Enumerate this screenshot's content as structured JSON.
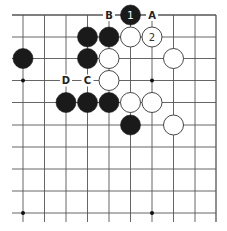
{
  "diagram": {
    "type": "go-board-section",
    "columns": 10,
    "rows": 10,
    "edges": {
      "top": true,
      "right": true,
      "left": false,
      "bottom": false
    },
    "grid": {
      "x": [
        23,
        44.5,
        66,
        87.5,
        109,
        130.5,
        152,
        173.5,
        195,
        216
      ],
      "y": [
        15,
        37,
        58.5,
        80.5,
        102.5,
        125,
        147,
        169,
        191,
        213
      ],
      "overhang_left": 12,
      "overhang_bottom": 222
    },
    "colors": {
      "line": "#555555",
      "black_stone": "#1a1a1a",
      "white_stone_fill": "#ffffff",
      "white_stone_stroke": "#333333",
      "text_on_black": "#ffffff",
      "text_on_white": "#333333",
      "label": "#222222"
    },
    "star_points": [
      {
        "col": 0,
        "row": 3
      },
      {
        "col": 6,
        "row": 3
      },
      {
        "col": 0,
        "row": 9
      },
      {
        "col": 6,
        "row": 9
      }
    ],
    "stones": [
      {
        "color": "black",
        "col": 5,
        "row": 0,
        "number": "1"
      },
      {
        "color": "black",
        "col": 3,
        "row": 1
      },
      {
        "color": "black",
        "col": 4,
        "row": 1
      },
      {
        "color": "white",
        "col": 5,
        "row": 1
      },
      {
        "color": "white",
        "col": 6,
        "row": 1,
        "number": "2"
      },
      {
        "color": "black",
        "col": 0,
        "row": 2
      },
      {
        "color": "black",
        "col": 3,
        "row": 2
      },
      {
        "color": "white",
        "col": 4,
        "row": 2
      },
      {
        "color": "white",
        "col": 7,
        "row": 2
      },
      {
        "color": "white",
        "col": 4,
        "row": 3
      },
      {
        "color": "black",
        "col": 2,
        "row": 4
      },
      {
        "color": "black",
        "col": 3,
        "row": 4
      },
      {
        "color": "black",
        "col": 4,
        "row": 4
      },
      {
        "color": "white",
        "col": 5,
        "row": 4
      },
      {
        "color": "white",
        "col": 6,
        "row": 4
      },
      {
        "color": "black",
        "col": 5,
        "row": 5
      },
      {
        "color": "white",
        "col": 7,
        "row": 5
      }
    ],
    "labels": [
      {
        "text": "B",
        "col": 4,
        "row": 0
      },
      {
        "text": "A",
        "col": 6,
        "row": 0
      },
      {
        "text": "D",
        "col": 2,
        "row": 3
      },
      {
        "text": "C",
        "col": 3,
        "row": 3
      }
    ]
  }
}
